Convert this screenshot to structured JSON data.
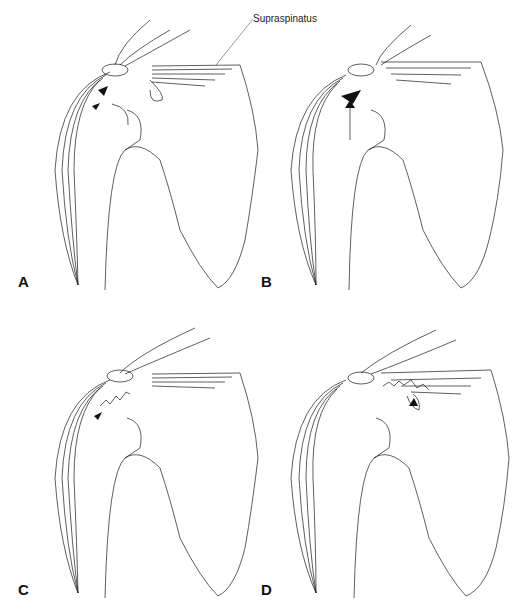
{
  "figure": {
    "callout_label": "Supraspinatus",
    "panels": [
      {
        "id": "A",
        "label": "A",
        "lesion": "partial-thickness tear (bursal side)",
        "arrow": "small"
      },
      {
        "id": "B",
        "label": "B",
        "lesion": "articular-side tear",
        "arrow": "long-upward"
      },
      {
        "id": "C",
        "label": "C",
        "lesion": "intratendinous frayed tear",
        "arrow": "small"
      },
      {
        "id": "D",
        "label": "D",
        "lesion": "full-thickness tear with retraction",
        "arrow": "small"
      }
    ],
    "colors": {
      "line": "#1a1a1a",
      "background": "#ffffff"
    }
  }
}
